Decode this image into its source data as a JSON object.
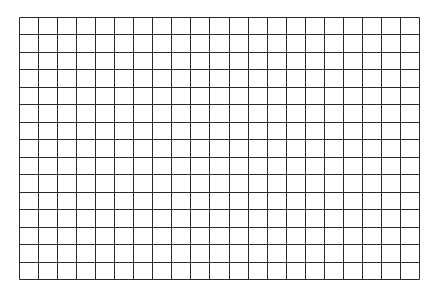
{
  "grid": {
    "left": 19,
    "top": 17,
    "width": 400,
    "height": 262,
    "columns": 21,
    "rows": 15,
    "line_color": "#2a2a2a",
    "line_width": 1,
    "background": "#ffffff"
  }
}
